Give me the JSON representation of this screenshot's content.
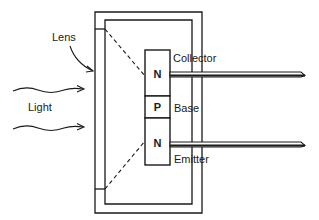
{
  "diagram": {
    "labels": {
      "lens": "Lens",
      "light": "Light",
      "collector": "Collector",
      "base": "Base",
      "emitter": "Emitter"
    },
    "regions": [
      {
        "id": "collector-region",
        "letter": "N"
      },
      {
        "id": "base-region",
        "letter": "P"
      },
      {
        "id": "emitter-region",
        "letter": "N"
      }
    ],
    "colors": {
      "ink": "#1a1a1a",
      "background": "#ffffff"
    }
  }
}
